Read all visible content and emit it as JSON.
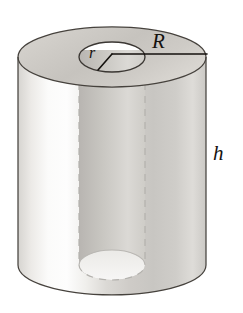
{
  "figure": {
    "name": "hollow-cylinder-diagram",
    "labels": {
      "outer_radius": "R",
      "inner_radius": "r",
      "height": "h"
    },
    "colors": {
      "background": "#ffffff",
      "outline": "#3f3b36",
      "annotation_line": "#14110e",
      "label_text": "#15120f",
      "top_face_light": "#dedbd6",
      "top_face_dark": "#b8b5b0",
      "body_light": "#fdfdfd",
      "body_mid": "#d2d0cc",
      "body_dark": "#c3c1bd",
      "bore_shadow": "#cfcdc9",
      "dashed_line": "#b0aeaa"
    },
    "geometry": {
      "outer_radius_x": 94,
      "outer_radius_y": 30,
      "inner_radius_x": 33,
      "inner_radius_y": 15,
      "top_center_x": 112,
      "top_center_y": 57,
      "bottom_center_y": 265,
      "cylinder_left_x": 18,
      "cylinder_right_x": 206,
      "radius_line_end_x": 207,
      "radius_line_y": 54
    },
    "annotations": {
      "outer_radius_leader": "horizontal line from bore center to outer rim of top face",
      "inner_radius_leader": "short segment from bore center to lower-left of bore rim",
      "hidden_edges": "dashed vertical lines showing the hidden bore walls and the bore's bottom rim"
    }
  }
}
